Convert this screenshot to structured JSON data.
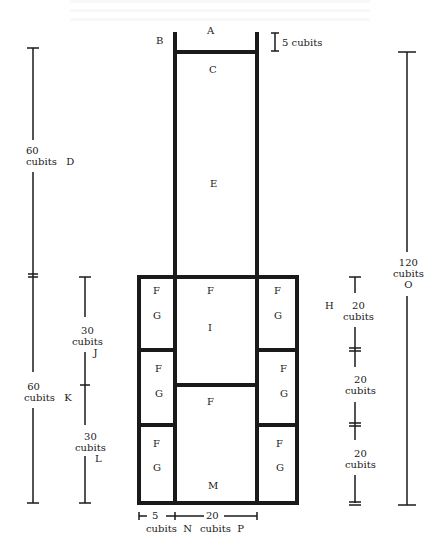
{
  "diagram": {
    "line_color": "#1a1a1a",
    "background": "#ffffff",
    "region_labels": {
      "A": "A",
      "B": "B",
      "C": "C",
      "D": "D",
      "E": "E",
      "H": "H",
      "I": "I",
      "J": "J",
      "K": "K",
      "L": "L",
      "M": "M",
      "N": "N",
      "O": "O",
      "P": "P"
    },
    "chamber_labels": {
      "F": "F",
      "G": "G"
    },
    "dimensions": {
      "top_band": {
        "value": "5 cubits"
      },
      "left_upper": {
        "value": "60",
        "unit": "cubits",
        "letter": "D"
      },
      "left_lower": {
        "value": "60",
        "unit": "cubits",
        "letter": "K"
      },
      "inner_upper": {
        "value": "30",
        "unit": "cubits",
        "letter": "J"
      },
      "inner_lower": {
        "value": "30",
        "unit": "cubits",
        "letter": "L"
      },
      "right_total": {
        "value": "120",
        "unit": "cubits",
        "letter": "O"
      },
      "right_seg_1": {
        "value": "20",
        "unit": "cubits"
      },
      "right_seg_2": {
        "value": "20",
        "unit": "cubits"
      },
      "right_seg_3": {
        "value": "20",
        "unit": "cubits"
      },
      "bottom_side": {
        "value": "5",
        "unit": "cubits",
        "letter": "N"
      },
      "bottom_center": {
        "value": "20",
        "unit": "cubits",
        "letter": "P"
      }
    }
  }
}
